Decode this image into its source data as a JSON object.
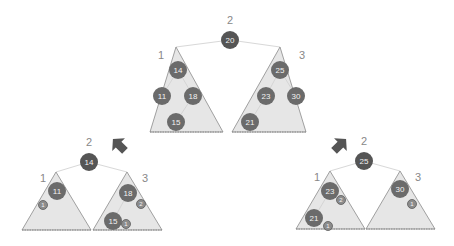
{
  "colors": {
    "triangle_fill": "#e6e6e6",
    "triangle_stroke": "#8a8a8a",
    "node_fill": "#6b6b6b",
    "node_text": "#f2f2f2",
    "badge_fill": "#8c8c8c",
    "badge_stroke": "#5a5a5a",
    "edge": "#d8d8d8",
    "label": "#888888",
    "arrow": "#555555"
  },
  "top_tree": {
    "root": {
      "value": "20",
      "label": "2",
      "x": 230,
      "y": 40
    },
    "left_subtree": {
      "label": "1",
      "apex": [
        176,
        47
      ],
      "base_left": [
        150,
        132
      ],
      "base_right": [
        223,
        132
      ],
      "label_pos": [
        161,
        55
      ],
      "nodes": [
        {
          "value": "14",
          "x": 178,
          "y": 70
        },
        {
          "value": "11",
          "x": 162,
          "y": 96
        },
        {
          "value": "18",
          "x": 193,
          "y": 96
        },
        {
          "value": "15",
          "x": 176,
          "y": 122
        }
      ]
    },
    "right_subtree": {
      "label": "3",
      "apex": [
        280,
        47
      ],
      "base_left": [
        232,
        132
      ],
      "base_right": [
        306,
        132
      ],
      "label_pos": [
        302,
        55
      ],
      "nodes": [
        {
          "value": "25",
          "x": 280,
          "y": 70
        },
        {
          "value": "23",
          "x": 266,
          "y": 96
        },
        {
          "value": "30",
          "x": 296,
          "y": 96
        },
        {
          "value": "21",
          "x": 250,
          "y": 122
        }
      ]
    }
  },
  "bottom_left_tree": {
    "root": {
      "value": "14",
      "label": "2",
      "x": 89,
      "y": 162
    },
    "left_subtree": {
      "label": "1",
      "apex": [
        56,
        172
      ],
      "base_left": [
        22,
        230
      ],
      "base_right": [
        91,
        230
      ],
      "label_pos": [
        43,
        178
      ],
      "nodes": [
        {
          "value": "11",
          "x": 57,
          "y": 191,
          "badge": "1",
          "bx": 43,
          "by": 205
        }
      ]
    },
    "right_subtree": {
      "label": "3",
      "apex": [
        127,
        172
      ],
      "base_left": [
        93,
        230
      ],
      "base_right": [
        162,
        230
      ],
      "label_pos": [
        145,
        178
      ],
      "nodes": [
        {
          "value": "18",
          "x": 128,
          "y": 193,
          "badge": "2",
          "bx": 141,
          "by": 204
        },
        {
          "value": "15",
          "x": 113,
          "y": 221,
          "badge": "1",
          "bx": 126,
          "by": 224
        }
      ]
    }
  },
  "bottom_right_tree": {
    "root": {
      "value": "25",
      "label": "2",
      "x": 364,
      "y": 161
    },
    "left_subtree": {
      "label": "1",
      "apex": [
        330,
        171
      ],
      "base_left": [
        296,
        229
      ],
      "base_right": [
        365,
        229
      ],
      "label_pos": [
        317,
        177
      ],
      "nodes": [
        {
          "value": "23",
          "x": 330,
          "y": 191,
          "badge": "2",
          "bx": 341,
          "by": 200
        },
        {
          "value": "21",
          "x": 314,
          "y": 218,
          "badge": "1",
          "bx": 328,
          "by": 226
        }
      ]
    },
    "right_subtree": {
      "label": "3",
      "apex": [
        400,
        171
      ],
      "base_left": [
        366,
        229
      ],
      "base_right": [
        435,
        229
      ],
      "label_pos": [
        418,
        177
      ],
      "nodes": [
        {
          "value": "30",
          "x": 400,
          "y": 189,
          "badge": "1",
          "bx": 412,
          "by": 204
        }
      ]
    }
  },
  "arrows": [
    {
      "name": "arrow-down-left",
      "x": 120,
      "y": 146,
      "rotation": 225
    },
    {
      "name": "arrow-down-right",
      "x": 339,
      "y": 146,
      "rotation": 315
    }
  ]
}
